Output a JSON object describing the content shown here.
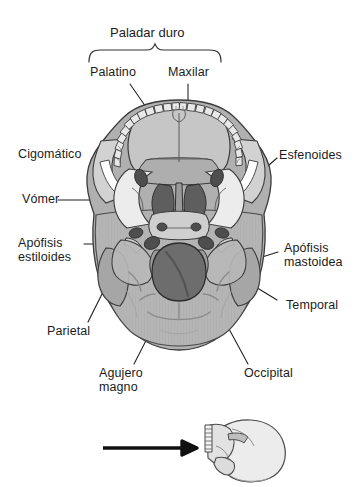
{
  "figure": {
    "kind": "anatomical-illustration",
    "language": "es",
    "bracket_title": "Paladar duro",
    "labels": [
      {
        "id": "palatino",
        "text": "Palatino",
        "side": "top-left"
      },
      {
        "id": "maxilar",
        "text": "Maxilar",
        "side": "top-right"
      },
      {
        "id": "cigomatico",
        "text": "Cigomático",
        "side": "left"
      },
      {
        "id": "vomer",
        "text": "Vómer",
        "side": "left"
      },
      {
        "id": "apofisis-estiloides",
        "text": "Apófisis",
        "text2": "estiloides",
        "side": "left"
      },
      {
        "id": "parietal",
        "text": "Parietal",
        "side": "left"
      },
      {
        "id": "esfenoides",
        "text": "Esfenoides",
        "side": "right"
      },
      {
        "id": "apofisis-mastoidea",
        "text": "Apófisis",
        "text2": "mastoidea",
        "side": "right"
      },
      {
        "id": "temporal",
        "text": "Temporal",
        "side": "right"
      },
      {
        "id": "agujero-magno",
        "text": "Agujero",
        "text2": "magno",
        "side": "bottom-left"
      },
      {
        "id": "occipital",
        "text": "Occipital",
        "side": "bottom-right"
      }
    ],
    "inset": {
      "kind": "lateral-skull-orientation-key",
      "arrow_direction": "right"
    },
    "colors": {
      "outline": "#3a3a3a",
      "leader": "#262626",
      "bone_light": "#d9d9d9",
      "bone_mid": "#b3b3b3",
      "bone_dark": "#8f8f8f",
      "cavity_dark": "#6a6a6a",
      "cavity_darkest": "#4f4f4f",
      "teeth": "#e6e6e6",
      "background": "#ffffff"
    }
  }
}
